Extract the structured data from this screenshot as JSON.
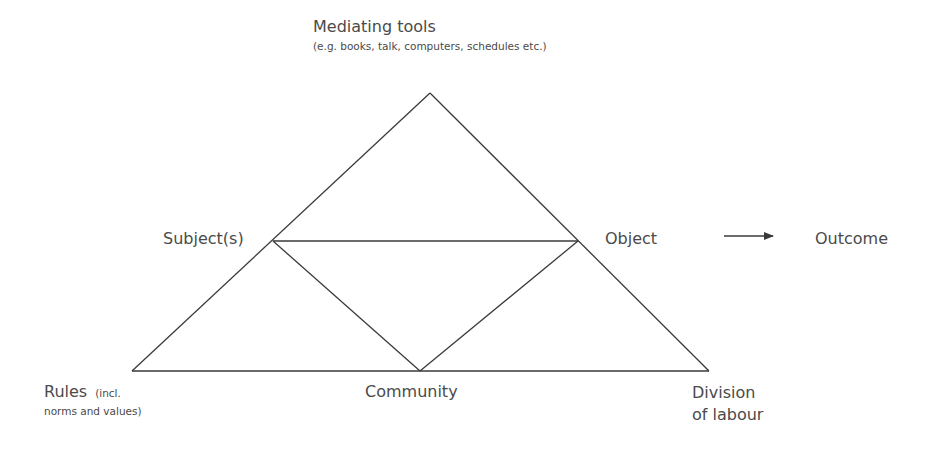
{
  "diagram": {
    "type": "activity-system-triangle",
    "line_color": "#3a3a3a",
    "text_color": "#4a4a4a",
    "nodes": {
      "mediating_tools": {
        "label": "Mediating tools",
        "sublabel": "(e.g. books, talk, computers, schedules etc.)"
      },
      "subject": {
        "label": "Subject(s)"
      },
      "object": {
        "label": "Object"
      },
      "outcome": {
        "label": "Outcome"
      },
      "rules": {
        "label": "Rules",
        "sublabel_line1": "(incl.",
        "sublabel_line2": "norms and values)"
      },
      "community": {
        "label": "Community"
      },
      "division_of_labour": {
        "label_line1": "Division",
        "label_line2": "of labour"
      }
    },
    "edges": [
      {
        "from": "mediating_tools",
        "to": "rules"
      },
      {
        "from": "mediating_tools",
        "to": "division_of_labour"
      },
      {
        "from": "rules",
        "to": "division_of_labour"
      },
      {
        "from": "subject",
        "to": "object"
      },
      {
        "from": "subject",
        "to": "community"
      },
      {
        "from": "object",
        "to": "community"
      },
      {
        "from": "object",
        "to": "outcome",
        "arrow": true
      }
    ]
  }
}
